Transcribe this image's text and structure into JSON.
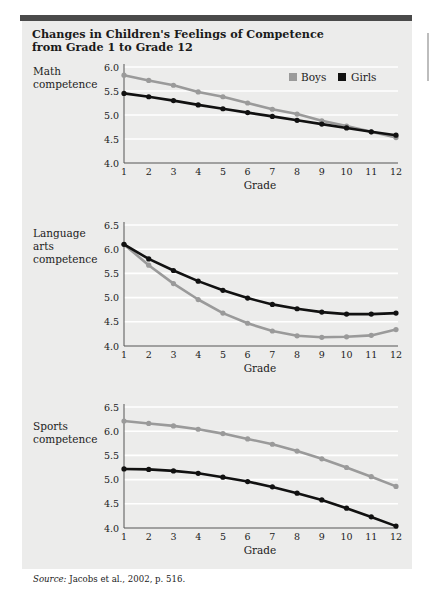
{
  "figure": {
    "title_line1": "Changes in Children's Feelings of Competence",
    "title_line2": "from Grade 1 to Grade 12",
    "source_label": "Source:",
    "source_text": " Jacobs et al., 2002, p. 516."
  },
  "legend": {
    "boys_label": "Boys",
    "girls_label": "Girls",
    "boys_color": "#9a9a9a",
    "girls_color": "#111111"
  },
  "chart_data": [
    {
      "type": "line",
      "title": "Math competence",
      "ylabel_lines": [
        "Math",
        "competence"
      ],
      "xlabel": "Grade",
      "x": [
        1,
        2,
        3,
        4,
        5,
        6,
        7,
        8,
        9,
        10,
        11,
        12
      ],
      "ylim": [
        4.0,
        6.0
      ],
      "yticks": [
        "6.0",
        "5.5",
        "5.0",
        "4.5",
        "4.0"
      ],
      "grid": true,
      "legend_position": "upper right",
      "series": [
        {
          "name": "Boys",
          "values": [
            5.83,
            5.72,
            5.62,
            5.48,
            5.38,
            5.25,
            5.12,
            5.02,
            4.88,
            4.77,
            4.65,
            4.53
          ]
        },
        {
          "name": "Girls",
          "values": [
            5.45,
            5.38,
            5.3,
            5.21,
            5.13,
            5.05,
            4.97,
            4.89,
            4.81,
            4.73,
            4.65,
            4.58
          ]
        }
      ]
    },
    {
      "type": "line",
      "title": "Language arts competence",
      "ylabel_lines": [
        "Language",
        "arts",
        "competence"
      ],
      "xlabel": "Grade",
      "x": [
        1,
        2,
        3,
        4,
        5,
        6,
        7,
        8,
        9,
        10,
        11,
        12
      ],
      "ylim": [
        4.0,
        6.5
      ],
      "yticks": [
        "6.5",
        "6.0",
        "5.5",
        "5.0",
        "4.5",
        "4.0"
      ],
      "grid": true,
      "series": [
        {
          "name": "Boys",
          "values": [
            6.1,
            5.67,
            5.29,
            4.96,
            4.68,
            4.47,
            4.31,
            4.21,
            4.18,
            4.19,
            4.22,
            4.34
          ]
        },
        {
          "name": "Girls",
          "values": [
            6.1,
            5.8,
            5.56,
            5.34,
            5.15,
            4.99,
            4.86,
            4.77,
            4.7,
            4.66,
            4.66,
            4.68
          ]
        }
      ]
    },
    {
      "type": "line",
      "title": "Sports competence",
      "ylabel_lines": [
        "Sports",
        "competence"
      ],
      "xlabel": "Grade",
      "x": [
        1,
        2,
        3,
        4,
        5,
        6,
        7,
        8,
        9,
        10,
        11,
        12
      ],
      "ylim": [
        4.0,
        6.5
      ],
      "yticks": [
        "6.5",
        "6.0",
        "5.5",
        "5.0",
        "4.5",
        "4.0"
      ],
      "grid": true,
      "series": [
        {
          "name": "Boys",
          "values": [
            6.21,
            6.16,
            6.11,
            6.04,
            5.95,
            5.84,
            5.73,
            5.59,
            5.43,
            5.25,
            5.06,
            4.86
          ]
        },
        {
          "name": "Girls",
          "values": [
            5.22,
            5.21,
            5.18,
            5.13,
            5.05,
            4.96,
            4.85,
            4.72,
            4.58,
            4.41,
            4.23,
            4.04
          ]
        }
      ]
    }
  ]
}
